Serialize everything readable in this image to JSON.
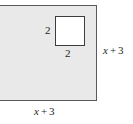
{
  "figure": {
    "colors": {
      "outer_fill": "#e9e9e9",
      "outer_stroke": "#5a5a5a",
      "inner_fill": "#ffffff",
      "inner_stroke": "#3d3d3d",
      "text": "#231f20",
      "background": "#ffffff"
    },
    "outer_shape": {
      "name": "shaded-rectangle",
      "right_side_label": "x + 3",
      "bottom_side_label": "x + 3"
    },
    "inner_shape": {
      "name": "white-square-cutout",
      "left_side_label": "2",
      "bottom_side_label": "2"
    },
    "labels": {
      "square_left": "2",
      "square_bottom": "2",
      "right_side": {
        "variable": "x",
        "operator": "+",
        "constant": "3"
      },
      "bottom_side": {
        "variable": "x",
        "operator": "+",
        "constant": "3"
      }
    }
  }
}
